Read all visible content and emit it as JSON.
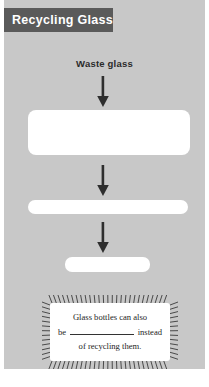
{
  "worksheet": {
    "title": "Recycling Glass",
    "title_banner_color": "#5a5a5a",
    "panel_color": "#c8c8c8",
    "input_label": "Waste glass"
  },
  "flow": {
    "arrows": [
      {
        "name": "arrow-1"
      },
      {
        "name": "arrow-2"
      },
      {
        "name": "arrow-3"
      }
    ],
    "answer_boxes": [
      {
        "name": "answer-box-1",
        "value": ""
      },
      {
        "name": "answer-box-2",
        "value": ""
      },
      {
        "name": "answer-box-3",
        "value": ""
      }
    ]
  },
  "callout": {
    "line1": "Glass bottles can also",
    "line2_before": "be",
    "line2_after": "instead",
    "line3": "of recycling them."
  }
}
